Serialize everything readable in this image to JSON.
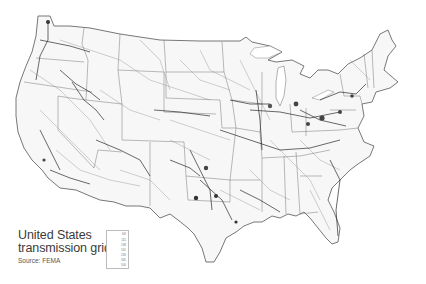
{
  "map": {
    "title_line1": "United States",
    "title_line2": "transmission grid",
    "source": "Source: FEMA",
    "region": "Contiguous United States",
    "background_color": "#ffffff",
    "line_color": "#222222",
    "border_color": "#555555"
  },
  "legend": {
    "unit": "kV",
    "entries": [
      {
        "label": "115"
      },
      {
        "label": "138"
      },
      {
        "label": "161"
      },
      {
        "label": "230"
      },
      {
        "label": "345"
      },
      {
        "label": "500"
      }
    ]
  }
}
